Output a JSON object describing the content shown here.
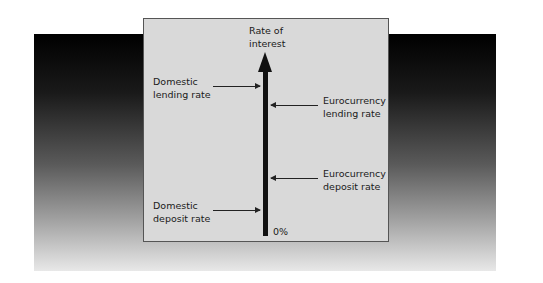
{
  "diagram": {
    "axis_title": "Rate of\ninterest",
    "axis_origin_label": "0%",
    "labels": {
      "domestic_lending": "Domestic\nlending rate",
      "euro_lending": "Eurocurrency\nlending rate",
      "euro_deposit": "Eurocurrency\ndeposit rate",
      "domestic_deposit": "Domestic\ndeposit rate"
    },
    "order_high_to_low": [
      "Domestic lending rate",
      "Eurocurrency lending rate",
      "Eurocurrency deposit rate",
      "Domestic deposit rate"
    ],
    "colors": {
      "panel": "#d9d9d9",
      "axis": "#111111"
    }
  }
}
